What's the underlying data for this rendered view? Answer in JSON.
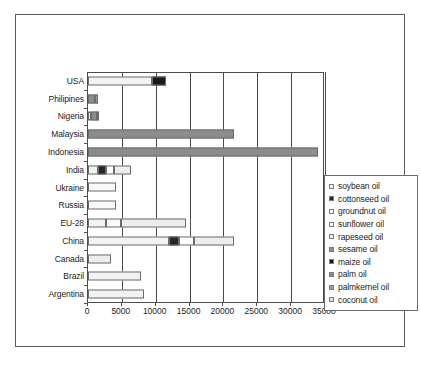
{
  "chart_data": {
    "type": "bar",
    "orientation": "horizontal",
    "stacked": true,
    "title": "",
    "xlabel": "",
    "ylabel": "",
    "xlim": [
      0,
      35000
    ],
    "xticks": [
      0,
      5000,
      10000,
      15000,
      20000,
      25000,
      30000,
      35000
    ],
    "xtick_labels": [
      "0",
      "5000",
      "10000",
      "15000",
      "20000",
      "25000",
      "30000",
      "35000"
    ],
    "grid": true,
    "legend_position": "right",
    "categories": [
      "USA",
      "Philipines",
      "Nigeria",
      "Malaysia",
      "Indonesia",
      "India",
      "Ukraine",
      "Russia",
      "EU-28",
      "China",
      "Canada",
      "Brazil",
      "Argentina"
    ],
    "series": [
      {
        "name": "soybean oil",
        "color": "#f2f2f2",
        "values": [
          9500,
          0,
          0,
          0,
          0,
          1500,
          0,
          0,
          2600,
          12000,
          0,
          7900,
          8200
        ]
      },
      {
        "name": "cottonseed oil",
        "color": "#262626",
        "values": [
          0,
          0,
          0,
          0,
          0,
          1200,
          0,
          0,
          0,
          1400,
          0,
          0,
          0
        ]
      },
      {
        "name": "groundnut oil",
        "color": "#ffffff",
        "values": [
          0,
          0,
          400,
          0,
          0,
          1200,
          0,
          0,
          0,
          2300,
          0,
          0,
          0
        ]
      },
      {
        "name": "sunflower oil",
        "color": "#fafafa",
        "values": [
          0,
          0,
          0,
          0,
          0,
          0,
          4200,
          4200,
          2300,
          0,
          0,
          0,
          0
        ]
      },
      {
        "name": "rapeseed oil",
        "color": "#ededed",
        "values": [
          0,
          0,
          0,
          0,
          0,
          2400,
          0,
          0,
          9600,
          5800,
          3400,
          0,
          0
        ]
      },
      {
        "name": "sesame oil",
        "color": "#8f8f8f",
        "values": [
          0,
          0,
          0,
          0,
          0,
          0,
          0,
          0,
          0,
          0,
          0,
          0,
          0
        ]
      },
      {
        "name": "maize oil",
        "color": "#1a1a1a",
        "values": [
          2000,
          0,
          0,
          0,
          0,
          0,
          0,
          0,
          0,
          0,
          0,
          0,
          0
        ]
      },
      {
        "name": "palm oil",
        "color": "#8c8c8c",
        "values": [
          0,
          1000,
          900,
          21500,
          34000,
          0,
          0,
          0,
          0,
          0,
          0,
          0,
          0
        ]
      },
      {
        "name": "palmkernel oil",
        "color": "#9e9e9e",
        "values": [
          0,
          450,
          200,
          0,
          0,
          0,
          0,
          0,
          0,
          0,
          0,
          0,
          0
        ]
      },
      {
        "name": "coconut oil",
        "color": "#e0e0e0",
        "values": [
          0,
          0,
          0,
          0,
          0,
          0,
          0,
          0,
          0,
          0,
          0,
          0,
          0
        ]
      }
    ]
  },
  "legend": {
    "items": [
      {
        "label": "soybean oil",
        "color": "#f2f2f2"
      },
      {
        "label": "cottonseed oil",
        "color": "#262626"
      },
      {
        "label": "groundnut oil",
        "color": "#ffffff"
      },
      {
        "label": "sunflower oil",
        "color": "#fcfcfc"
      },
      {
        "label": "rapeseed oil",
        "color": "#ededed"
      },
      {
        "label": "sesame oil",
        "color": "#8f8f8f"
      },
      {
        "label": "maize oil",
        "color": "#1a1a1a"
      },
      {
        "label": "palm oil",
        "color": "#8c8c8c"
      },
      {
        "label": "palmkernel oil",
        "color": "#9e9e9e"
      },
      {
        "label": "coconut oil",
        "color": "#e0e0e0"
      }
    ]
  }
}
